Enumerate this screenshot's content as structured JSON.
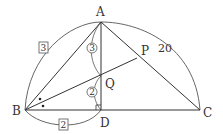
{
  "diagram": {
    "points": {
      "A": {
        "label": "A",
        "x": 101,
        "y": 22
      },
      "B": {
        "label": "B",
        "x": 25,
        "y": 110
      },
      "C": {
        "label": "C",
        "x": 200,
        "y": 110
      },
      "D": {
        "label": "D",
        "x": 101,
        "y": 110
      },
      "Q": {
        "label": "Q",
        "x": 101,
        "y": 76
      },
      "P": {
        "label": "P",
        "x": 137,
        "y": 58
      }
    },
    "segments": [
      "AB",
      "AC",
      "BC",
      "AD",
      "BP"
    ],
    "annotations": {
      "arc_AC_length": "20",
      "arc_AB_ratio": "3",
      "arc_BD_ratio": "2",
      "AQ_ratio": "3",
      "QD_ratio": "2"
    },
    "marks": {
      "equal_angle_dots": 2,
      "right_angle_at": "D"
    },
    "colors": {
      "stroke": "#333333",
      "background": "#ffffff"
    }
  }
}
